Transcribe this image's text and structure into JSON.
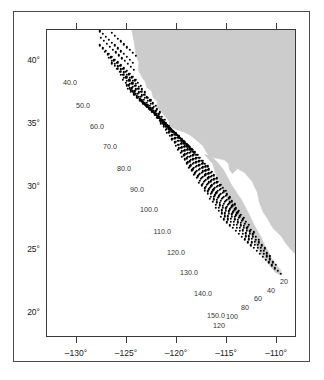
{
  "figure": {
    "kind": "station-map",
    "background": "#ffffff",
    "land_color": "#cccccc",
    "dot_color": "#000000",
    "axis_color": "#3a3a3a"
  },
  "chart_data": {
    "type": "scatter",
    "title": "",
    "xlabel": "",
    "ylabel": "",
    "xlim": [
      -133.0,
      -108.0
    ],
    "ylim": [
      18.0,
      42.5
    ],
    "grid": false,
    "legend": null,
    "x_ticks": [
      -130,
      -125,
      -120,
      -115,
      -110
    ],
    "x_tick_labels": [
      "–130°",
      "–125°",
      "–120°",
      "–115°",
      "–110°"
    ],
    "y_ticks": [
      40,
      35,
      30,
      25,
      20
    ],
    "y_tick_labels": [
      "40°",
      "35°",
      "30°",
      "25°",
      "20°"
    ],
    "line_labels": [
      {
        "text": "40.0",
        "x": -130.0,
        "y": 38.35
      },
      {
        "text": "50.0",
        "x": -128.7,
        "y": 36.55
      },
      {
        "text": "60.0",
        "x": -127.3,
        "y": 34.85
      },
      {
        "text": "70.0",
        "x": -126.0,
        "y": 33.25
      },
      {
        "text": "80.0",
        "x": -124.6,
        "y": 31.55
      },
      {
        "text": "90.0",
        "x": -123.3,
        "y": 29.85
      },
      {
        "text": "100.0",
        "x": -121.9,
        "y": 28.25
      },
      {
        "text": "110.0",
        "x": -120.6,
        "y": 26.55
      },
      {
        "text": "120.0",
        "x": -119.2,
        "y": 24.85
      },
      {
        "text": "130.0",
        "x": -117.9,
        "y": 23.25
      },
      {
        "text": "140.0",
        "x": -116.5,
        "y": 21.55
      },
      {
        "text": "150.0",
        "x": -115.2,
        "y": 19.85
      }
    ],
    "station_labels": [
      {
        "text": "20",
        "x": -109.3,
        "y": 22.55
      },
      {
        "text": "40",
        "x": -110.6,
        "y": 21.85
      },
      {
        "text": "60",
        "x": -111.9,
        "y": 21.15
      },
      {
        "text": "80",
        "x": -113.2,
        "y": 20.45
      },
      {
        "text": "100",
        "x": -114.5,
        "y": 19.75
      },
      {
        "text": "120",
        "x": -115.8,
        "y": 19.05
      }
    ],
    "station_point_count": 399,
    "series": [
      {
        "name": "survey stations",
        "marker": "filled-circle",
        "color": "#000000",
        "lines": [
          {
            "line": 40.0,
            "origin": [
              -124.15,
              40.45
            ],
            "step": [
              -0.3,
              0.228
            ],
            "n": 12,
            "start_station": 30
          },
          {
            "line": 43.0,
            "origin": [
              -124.4,
              39.9
            ],
            "step": [
              -0.3,
              0.228
            ],
            "n": 12,
            "start_station": 30
          },
          {
            "line": 46.0,
            "origin": [
              -124.3,
              39.35
            ],
            "step": [
              -0.3,
              0.228
            ],
            "n": 12,
            "start_station": 30
          },
          {
            "line": 50.0,
            "origin": [
              -124.1,
              38.55
            ],
            "step": [
              -0.3,
              0.228
            ],
            "n": 13,
            "start_station": 30
          },
          {
            "line": 53.0,
            "origin": [
              -123.6,
              38.05
            ],
            "step": [
              -0.3,
              0.228
            ],
            "n": 13,
            "start_station": 30
          },
          {
            "line": 56.0,
            "origin": [
              -123.2,
              37.55
            ],
            "step": [
              -0.3,
              0.228
            ],
            "n": 13,
            "start_station": 30
          },
          {
            "line": 60.0,
            "origin": [
              -122.6,
              36.9
            ],
            "step": [
              -0.3,
              0.228
            ],
            "n": 14,
            "start_station": 30
          },
          {
            "line": 63.0,
            "origin": [
              -122.1,
              36.45
            ],
            "step": [
              -0.3,
              0.228
            ],
            "n": 14,
            "start_station": 30
          },
          {
            "line": 66.0,
            "origin": [
              -121.75,
              35.95
            ],
            "step": [
              -0.3,
              0.228
            ],
            "n": 14,
            "start_station": 30
          },
          {
            "line": 70.0,
            "origin": [
              -121.25,
              35.35
            ],
            "step": [
              -0.3,
              0.228
            ],
            "n": 15,
            "start_station": 30
          },
          {
            "line": 73.0,
            "origin": [
              -120.85,
              34.9
            ],
            "step": [
              -0.3,
              0.228
            ],
            "n": 15,
            "start_station": 30
          },
          {
            "line": 76.7,
            "origin": [
              -120.45,
              34.4
            ],
            "step": [
              -0.3,
              0.228
            ],
            "n": 16,
            "start_station": 28
          },
          {
            "line": 80.0,
            "origin": [
              -119.85,
              34.05
            ],
            "step": [
              -0.3,
              0.228
            ],
            "n": 17,
            "start_station": 26
          },
          {
            "line": 83.3,
            "origin": [
              -119.45,
              33.7
            ],
            "step": [
              -0.3,
              0.228
            ],
            "n": 17,
            "start_station": 26
          },
          {
            "line": 86.7,
            "origin": [
              -118.95,
              33.35
            ],
            "step": [
              -0.3,
              0.228
            ],
            "n": 17,
            "start_station": 26
          },
          {
            "line": 90.0,
            "origin": [
              -118.4,
              32.95
            ],
            "step": [
              -0.3,
              0.228
            ],
            "n": 18,
            "start_station": 26
          },
          {
            "line": 93.3,
            "origin": [
              -117.9,
              32.55
            ],
            "step": [
              -0.3,
              0.228
            ],
            "n": 18,
            "start_station": 26
          },
          {
            "line": 96.7,
            "origin": [
              -117.4,
              32.1
            ],
            "step": [
              -0.3,
              0.228
            ],
            "n": 18,
            "start_station": 26
          },
          {
            "line": 100.0,
            "origin": [
              -116.95,
              31.65
            ],
            "step": [
              -0.3,
              0.228
            ],
            "n": 18,
            "start_station": 26
          },
          {
            "line": 103.3,
            "origin": [
              -116.5,
              31.2
            ],
            "step": [
              -0.3,
              0.228
            ],
            "n": 18,
            "start_station": 26
          },
          {
            "line": 106.7,
            "origin": [
              -116.05,
              30.7
            ],
            "step": [
              -0.3,
              0.228
            ],
            "n": 18,
            "start_station": 26
          },
          {
            "line": 110.0,
            "origin": [
              -115.6,
              30.2
            ],
            "step": [
              -0.3,
              0.228
            ],
            "n": 19,
            "start_station": 26
          },
          {
            "line": 113.3,
            "origin": [
              -115.15,
              29.7
            ],
            "step": [
              -0.3,
              0.228
            ],
            "n": 19,
            "start_station": 26
          },
          {
            "line": 116.7,
            "origin": [
              -114.7,
              29.2
            ],
            "step": [
              -0.3,
              0.228
            ],
            "n": 19,
            "start_station": 26
          },
          {
            "line": 120.0,
            "origin": [
              -114.25,
              28.65
            ],
            "step": [
              -0.3,
              0.228
            ],
            "n": 20,
            "start_station": 26
          },
          {
            "line": 123.3,
            "origin": [
              -113.8,
              28.1
            ],
            "step": [
              -0.3,
              0.228
            ],
            "n": 20,
            "start_station": 26
          },
          {
            "line": 126.7,
            "origin": [
              -113.35,
              27.55
            ],
            "step": [
              -0.3,
              0.228
            ],
            "n": 20,
            "start_station": 26
          },
          {
            "line": 130.0,
            "origin": [
              -112.85,
              27.0
            ],
            "step": [
              -0.3,
              0.228
            ],
            "n": 21,
            "start_station": 26
          },
          {
            "line": 133.3,
            "origin": [
              -112.35,
              26.4
            ],
            "step": [
              -0.3,
              0.228
            ],
            "n": 21,
            "start_station": 26
          },
          {
            "line": 136.7,
            "origin": [
              -111.8,
              25.8
            ],
            "step": [
              -0.3,
              0.228
            ],
            "n": 21,
            "start_station": 26
          },
          {
            "line": 140.0,
            "origin": [
              -111.25,
              25.15
            ],
            "step": [
              -0.3,
              0.228
            ],
            "n": 21,
            "start_station": 26
          },
          {
            "line": 143.3,
            "origin": [
              -110.7,
              24.5
            ],
            "step": [
              -0.3,
              0.228
            ],
            "n": 21,
            "start_station": 26
          },
          {
            "line": 146.7,
            "origin": [
              -110.15,
              23.8
            ],
            "step": [
              -0.3,
              0.228
            ],
            "n": 21,
            "start_station": 26
          },
          {
            "line": 150.0,
            "origin": [
              -109.6,
              23.1
            ],
            "step": [
              -0.3,
              0.228
            ],
            "n": 21,
            "start_station": 26
          }
        ]
      }
    ],
    "land_polygons": [
      {
        "name": "north-america-mainland",
        "points": [
          [
            -124.45,
            42.5
          ],
          [
            -124.2,
            41.5
          ],
          [
            -124.05,
            40.6
          ],
          [
            -123.75,
            39.9
          ],
          [
            -123.8,
            39.3
          ],
          [
            -123.4,
            38.7
          ],
          [
            -123.05,
            38.3
          ],
          [
            -122.95,
            37.9
          ],
          [
            -122.45,
            37.6
          ],
          [
            -122.3,
            37.1
          ],
          [
            -121.9,
            36.8
          ],
          [
            -121.85,
            36.3
          ],
          [
            -121.3,
            35.8
          ],
          [
            -120.7,
            35.2
          ],
          [
            -120.65,
            34.8
          ],
          [
            -120.05,
            34.55
          ],
          [
            -119.25,
            34.35
          ],
          [
            -118.5,
            34.05
          ],
          [
            -117.9,
            33.65
          ],
          [
            -117.3,
            33.25
          ],
          [
            -116.95,
            32.75
          ],
          [
            -116.6,
            32.35
          ],
          [
            -115.1,
            32.1
          ],
          [
            -114.7,
            31.8
          ],
          [
            -114.6,
            31.3
          ],
          [
            -114.3,
            31.0
          ],
          [
            -113.8,
            31.4
          ],
          [
            -113.1,
            31.1
          ],
          [
            -112.35,
            30.4
          ],
          [
            -111.8,
            29.5
          ],
          [
            -111.6,
            28.7
          ],
          [
            -111.2,
            27.9
          ],
          [
            -110.7,
            27.3
          ],
          [
            -110.2,
            26.6
          ],
          [
            -109.4,
            26.0
          ],
          [
            -109.0,
            25.5
          ],
          [
            -108.5,
            25.0
          ],
          [
            -108.0,
            24.6
          ],
          [
            -108.0,
            42.5
          ]
        ]
      },
      {
        "name": "baja-california-peninsula",
        "points": [
          [
            -117.12,
            32.53
          ],
          [
            -116.3,
            31.8
          ],
          [
            -116.0,
            31.0
          ],
          [
            -115.6,
            30.4
          ],
          [
            -115.3,
            29.7
          ],
          [
            -114.9,
            29.2
          ],
          [
            -114.6,
            28.6
          ],
          [
            -114.25,
            28.0
          ],
          [
            -113.6,
            27.4
          ],
          [
            -113.1,
            26.8
          ],
          [
            -112.6,
            26.3
          ],
          [
            -112.2,
            25.8
          ],
          [
            -111.9,
            25.3
          ],
          [
            -111.6,
            24.8
          ],
          [
            -111.2,
            24.3
          ],
          [
            -110.6,
            23.7
          ],
          [
            -110.0,
            23.1
          ],
          [
            -109.5,
            22.9
          ],
          [
            -109.42,
            23.25
          ],
          [
            -109.8,
            23.6
          ],
          [
            -110.35,
            24.2
          ],
          [
            -110.7,
            24.8
          ],
          [
            -111.1,
            25.3
          ],
          [
            -111.4,
            25.9
          ],
          [
            -111.85,
            26.5
          ],
          [
            -112.25,
            27.1
          ],
          [
            -112.6,
            27.7
          ],
          [
            -113.0,
            28.3
          ],
          [
            -113.4,
            28.9
          ],
          [
            -113.9,
            29.5
          ],
          [
            -114.4,
            30.1
          ],
          [
            -114.8,
            30.7
          ],
          [
            -115.2,
            31.3
          ],
          [
            -115.8,
            31.9
          ],
          [
            -116.5,
            32.45
          ]
        ]
      }
    ]
  }
}
